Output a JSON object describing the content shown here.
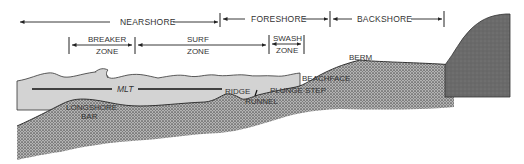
{
  "diagram": {
    "colors": {
      "water": "#d3d3d3",
      "sediment": "#9a9a9a",
      "sediment_dots": "#5a5a5a",
      "bedrock": "#6e6e6e",
      "lines": "#222222",
      "text": "#333333"
    },
    "top_zones": [
      {
        "id": "nearshore",
        "label": "NEARSHORE"
      },
      {
        "id": "foreshore",
        "label": "FORESHORE"
      },
      {
        "id": "backshore",
        "label": "BACKSHORE"
      }
    ],
    "sub_zones": [
      {
        "id": "breaker",
        "line1": "BREAKER",
        "line2": "ZONE"
      },
      {
        "id": "surf",
        "line1": "SURF",
        "line2": "ZONE"
      },
      {
        "id": "swash",
        "line1": "SWASH",
        "line2": "ZONE"
      }
    ],
    "features": {
      "mlt": "MLT",
      "berm": "BERM",
      "beachface": "BEACHFACE",
      "ridge": "RIDGE",
      "plunge_step": "PLUNGE STEP",
      "runnel": "RUNNEL",
      "longshore_line1": "LONGSHORE",
      "longshore_line2": "BAR"
    }
  }
}
